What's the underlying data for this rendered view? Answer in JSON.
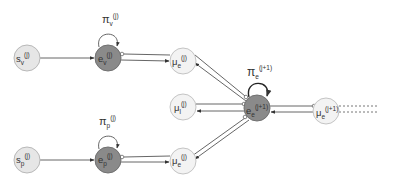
{
  "diagram": {
    "nodes": {
      "s_v": {
        "base": "s",
        "sub": "v",
        "sup": "(j)",
        "style": "light"
      },
      "e_v": {
        "base": "e",
        "sub": "v",
        "sup": "(j)",
        "style": "dark"
      },
      "mu_e_top": {
        "base": "μ",
        "sub": "e",
        "sup": "(j)",
        "style": "pale"
      },
      "mu_l": {
        "base": "μ",
        "sub": "l",
        "sup": "(j)",
        "style": "pale"
      },
      "e_e": {
        "base": "e",
        "sub": "e",
        "sup": "(j+1)",
        "style": "dark"
      },
      "mu_e_next": {
        "base": "μ",
        "sub": "e",
        "sup": "(j+1)",
        "style": "pale"
      },
      "s_p": {
        "base": "s",
        "sub": "p",
        "sup": "(j)",
        "style": "light"
      },
      "e_p": {
        "base": "e",
        "sub": "p",
        "sup": "(j)",
        "style": "dark"
      },
      "mu_e_bottom": {
        "base": "μ",
        "sub": "e",
        "sup": "(j)",
        "style": "pale"
      }
    },
    "loop_labels": {
      "pi_v": {
        "base": "π",
        "sub": "v",
        "sup": "(j)"
      },
      "pi_p": {
        "base": "π",
        "sub": "p",
        "sup": "(j)"
      },
      "pi_e": {
        "base": "π",
        "sub": "e",
        "sup": "(j+1)"
      }
    },
    "edges": [
      {
        "from": "s_v",
        "to": "e_v",
        "type": "arrow"
      },
      {
        "from": "e_v",
        "to": "mu_e_top",
        "type": "message-pair"
      },
      {
        "from": "s_p",
        "to": "e_p",
        "type": "arrow"
      },
      {
        "from": "e_p",
        "to": "mu_e_bottom",
        "type": "message-pair"
      },
      {
        "from": "e_e",
        "to": "mu_e_top",
        "type": "message-pair"
      },
      {
        "from": "e_e",
        "to": "mu_l",
        "type": "message-pair"
      },
      {
        "from": "e_e",
        "to": "mu_e_bottom",
        "type": "message-pair"
      },
      {
        "from": "mu_e_next",
        "to": "e_e",
        "type": "message-pair"
      },
      {
        "from": "mu_e_next",
        "to": "continuation",
        "type": "dashed"
      }
    ]
  }
}
